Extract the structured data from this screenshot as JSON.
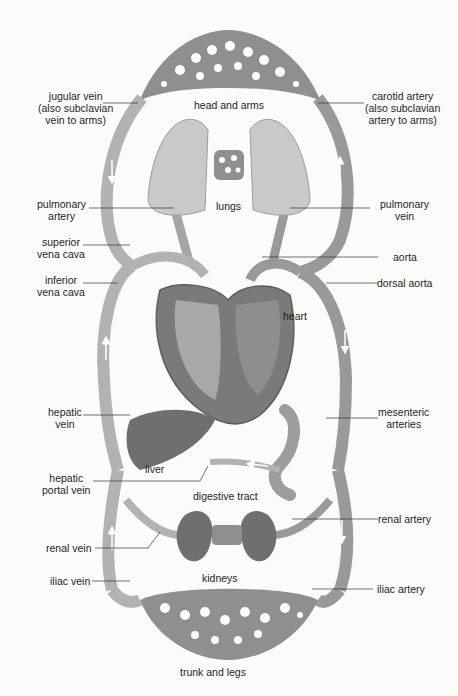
{
  "diagram": {
    "type": "circulatory-system",
    "organ_labels": {
      "head_and_arms": "head and arms",
      "lungs": "lungs",
      "heart": "heart",
      "liver": "liver",
      "digestive_tract": "digestive tract",
      "kidneys": "kidneys",
      "trunk_and_legs": "trunk and legs"
    },
    "left_labels": [
      {
        "id": "jugular-vein",
        "lines": [
          "jugular vein",
          "(also subclavian",
          "vein to arms)"
        ]
      },
      {
        "id": "pulmonary-artery",
        "lines": [
          "pulmonary",
          "artery"
        ]
      },
      {
        "id": "superior-vena-cava",
        "lines": [
          "superior",
          "vena cava"
        ]
      },
      {
        "id": "inferior-vena-cava",
        "lines": [
          "inferior",
          "vena cava"
        ]
      },
      {
        "id": "hepatic-vein",
        "lines": [
          "hepatic",
          "vein"
        ]
      },
      {
        "id": "hepatic-portal-vein",
        "lines": [
          "hepatic",
          "portal vein"
        ]
      },
      {
        "id": "renal-vein",
        "lines": [
          "renal vein"
        ]
      },
      {
        "id": "iliac-vein",
        "lines": [
          "iliac vein"
        ]
      }
    ],
    "right_labels": [
      {
        "id": "carotid-artery",
        "lines": [
          "carotid artery",
          "(also subclavian",
          "artery to arms)"
        ]
      },
      {
        "id": "pulmonary-vein",
        "lines": [
          "pulmonary",
          "vein"
        ]
      },
      {
        "id": "aorta",
        "lines": [
          "aorta"
        ]
      },
      {
        "id": "dorsal-aorta",
        "lines": [
          "dorsal aorta"
        ]
      },
      {
        "id": "mesenteric-arteries",
        "lines": [
          "mesenteric",
          "arteries"
        ]
      },
      {
        "id": "renal-artery",
        "lines": [
          "renal artery"
        ]
      },
      {
        "id": "iliac-artery",
        "lines": [
          "iliac artery"
        ]
      }
    ],
    "colors": {
      "vessel": "#a9a9a7",
      "vessel_dark": "#8a8a88",
      "organ_dark": "#6f6f6e",
      "lung": "#c9c9c7",
      "background": "#fbfbfa",
      "arrow": "#ffffff"
    }
  }
}
